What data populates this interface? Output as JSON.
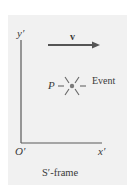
{
  "diagram": {
    "frame_label": "S′-frame",
    "axes": {
      "y_label": "y′",
      "x_label": "x′",
      "origin_label": "O′"
    },
    "velocity": {
      "label": "v",
      "direction": "right"
    },
    "event": {
      "point_label": "P",
      "label": "Event",
      "icon": "starburst-icon"
    },
    "colors": {
      "panel_bg": "#f1f1f1",
      "ink": "#4a4a4a",
      "arrow": "#555555"
    }
  }
}
